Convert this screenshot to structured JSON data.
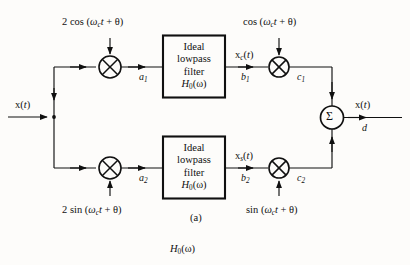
{
  "figure": {
    "caption": "(a)",
    "bottom_label_base": "H",
    "bottom_label_sub": "0",
    "bottom_label_arg": "(ω)",
    "background_color": "#fdfcfa",
    "line_color": "#101010"
  },
  "input": {
    "label_base": "x(",
    "label_var": "t",
    "label_close": ")"
  },
  "output": {
    "label_base": "x(",
    "label_var": "t",
    "label_close": ")",
    "node_label": "d"
  },
  "carriers": {
    "top_left": {
      "coef": "2 cos (",
      "omega": "ω",
      "sub": "c",
      "time": "t",
      "plus_theta": " + θ)"
    },
    "bottom_left": {
      "coef": "2 sin (",
      "omega": "ω",
      "sub": "c",
      "time": "t",
      "plus_theta": " + θ)"
    },
    "top_right": {
      "coef": "cos (",
      "omega": "ω",
      "sub": "c",
      "time": "t",
      "plus_theta": " + θ)"
    },
    "bottom_right": {
      "coef": "sin (",
      "omega": "ω",
      "sub": "c",
      "time": "t",
      "plus_theta": " + θ)"
    }
  },
  "filters": {
    "top": {
      "line1": "Ideal",
      "line2": "lowpass",
      "line3": "filter",
      "tf_base": "H",
      "tf_sub": "0",
      "tf_arg": "(ω)"
    },
    "bottom": {
      "line1": "Ideal",
      "line2": "lowpass",
      "line3": "filter",
      "tf_base": "H",
      "tf_sub": "0",
      "tf_arg": "(ω)"
    }
  },
  "signals": {
    "top_filter_out": {
      "base": "x",
      "sub": "c",
      "arg_open": "(",
      "arg_var": "t",
      "arg_close": ")"
    },
    "bottom_filter_out": {
      "base": "x",
      "sub": "s",
      "arg_open": "(",
      "arg_var": "t",
      "arg_close": ")"
    }
  },
  "nodes": {
    "a1": {
      "base": "a",
      "sub": "1"
    },
    "a2": {
      "base": "a",
      "sub": "2"
    },
    "b1": {
      "base": "b",
      "sub": "1"
    },
    "b2": {
      "base": "b",
      "sub": "2"
    },
    "c1": {
      "base": "c",
      "sub": "1"
    },
    "c2": {
      "base": "c",
      "sub": "2"
    }
  },
  "symbols": {
    "mixer": "⊗",
    "summer": "Σ"
  }
}
